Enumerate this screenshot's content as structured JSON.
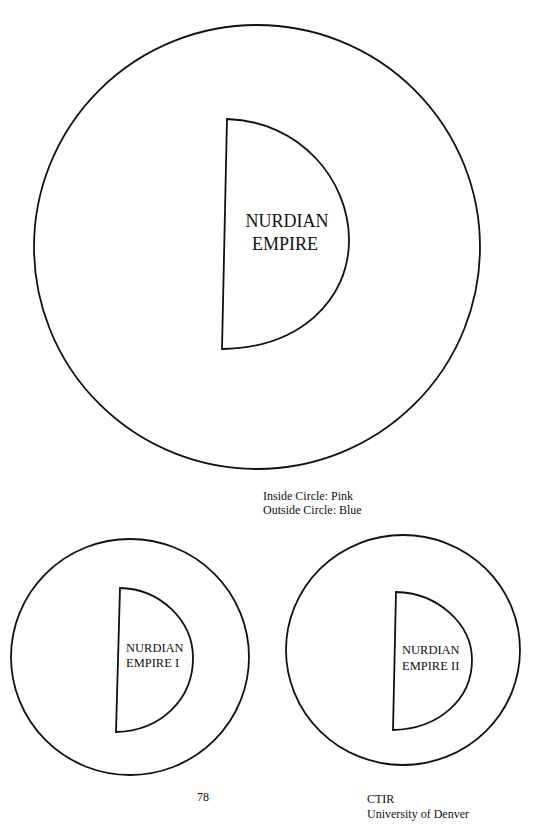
{
  "diagram": {
    "main": {
      "label_lines": [
        "NURDIAN",
        "EMPIRE"
      ],
      "inner_shape": "semicircle",
      "outer_shape": "circle"
    },
    "legend": {
      "inside": "Inside Circle: Pink",
      "outside": "Outside Circle: Blue"
    },
    "variants": [
      {
        "label_lines": [
          "NURDIAN",
          "EMPIRE I"
        ]
      },
      {
        "label_lines": [
          "NURDIAN",
          "EMPIRE II"
        ]
      }
    ],
    "colors": {
      "inside_circle": "Pink",
      "outside_circle": "Blue"
    }
  },
  "footer": {
    "page_number": "78",
    "org_line1": "CTIR",
    "org_line2": "University of Denver"
  }
}
